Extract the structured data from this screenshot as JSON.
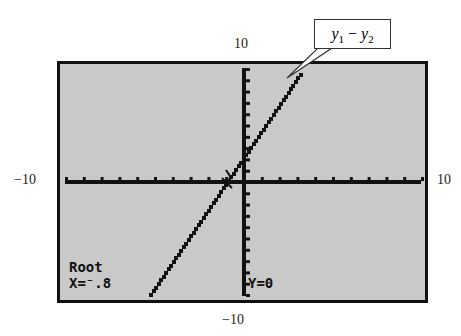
{
  "axis_labels": {
    "ymax": "10",
    "ymin": "−10",
    "xmin": "−10",
    "xmax": "10"
  },
  "callout": {
    "var1": "y",
    "sub1": "1",
    "op": " − ",
    "var2": "y",
    "sub2": "2"
  },
  "screen_text": {
    "mode": "Root",
    "x_readout": "X=⁻.8",
    "y_readout": "Y=0"
  },
  "colors": {
    "screen_bg": "#c9c9c9",
    "ink": "#111111"
  },
  "chart_data": {
    "type": "line",
    "title": "",
    "series": [
      {
        "name": "y1 - y2",
        "x": [
          -5.2,
          -0.8,
          3.2
        ],
        "y": [
          -10,
          0,
          9.5
        ]
      }
    ],
    "xlim": [
      -10,
      10
    ],
    "ylim": [
      -10,
      10
    ],
    "xscale": 1,
    "yscale": 1,
    "annotations": [
      "Root",
      "X=-.8",
      "Y=0",
      "y1 - y2"
    ],
    "grid": false,
    "legend": "callout label y1 - y2"
  }
}
